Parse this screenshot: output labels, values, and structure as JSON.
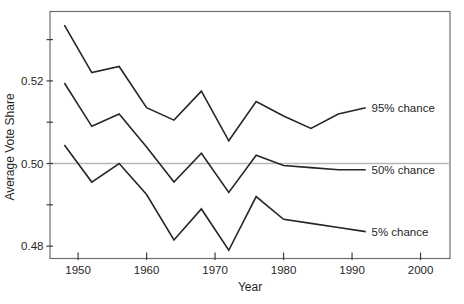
{
  "figure": {
    "background": "#ffffff"
  },
  "chart_data": {
    "type": "line",
    "title": "",
    "xlabel": "Year",
    "ylabel": "Average Vote Share",
    "x": [
      1948,
      1952,
      1956,
      1960,
      1964,
      1968,
      1972,
      1976,
      1980,
      1984,
      1988,
      1992
    ],
    "series": [
      {
        "name": "95% chance",
        "values": [
          0.5335,
          0.522,
          0.5235,
          0.5135,
          0.5105,
          0.5175,
          0.5055,
          0.515,
          0.5115,
          0.5085,
          0.512,
          0.5135
        ]
      },
      {
        "name": "50% chance",
        "values": [
          0.5195,
          0.509,
          0.512,
          0.504,
          0.4955,
          0.5025,
          0.493,
          0.502,
          0.4995,
          0.499,
          0.4985,
          0.4985
        ]
      },
      {
        "name": "5% chance",
        "values": [
          0.5045,
          0.4955,
          0.5,
          0.4925,
          0.4815,
          0.489,
          0.479,
          0.492,
          0.4865,
          0.4855,
          0.4845,
          0.4835
        ]
      }
    ],
    "xticks": [
      1950,
      1960,
      1970,
      1980,
      1990,
      2000
    ],
    "xtick_labels": [
      "1950",
      "1960",
      "1970",
      "1980",
      "1990",
      "2000"
    ],
    "yticks_minor": [
      0.48,
      0.49,
      0.5,
      0.51,
      0.52,
      0.53
    ],
    "yticks_labeled": [
      0.48,
      0.5,
      0.52
    ],
    "ytick_labels": [
      "0.48",
      "0.50",
      "0.52"
    ],
    "xlim": [
      1945.9,
      2004.3
    ],
    "ylim": [
      0.477,
      0.5368
    ],
    "reference_line_y": 0.5,
    "grid": false,
    "legend_position": "end-of-line-labels",
    "colors": {
      "series_line": "#262626",
      "frame": "#6e6e6e",
      "reference_line": "#b8b8b8",
      "text": "#1f1f1f"
    }
  }
}
